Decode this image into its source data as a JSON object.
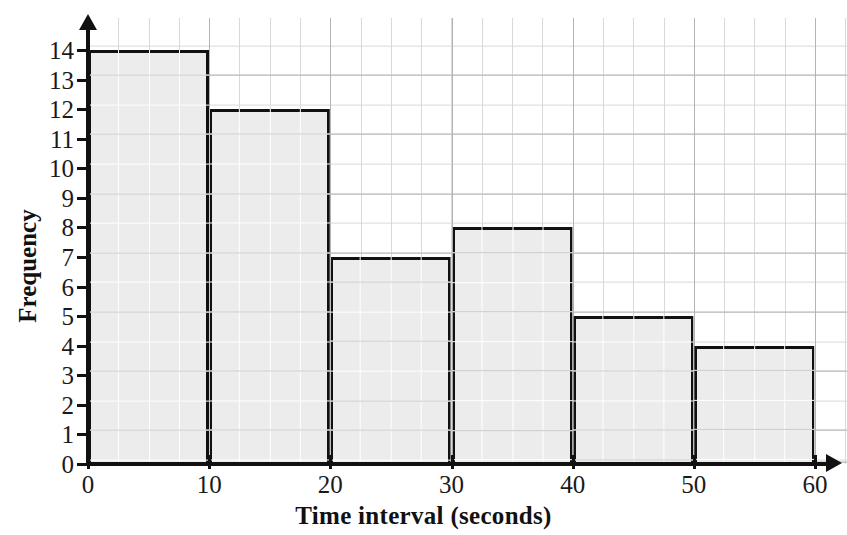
{
  "chart_data": {
    "type": "bar",
    "title": "",
    "xlabel": "Time interval (seconds)",
    "ylabel": "Frequency",
    "categories": [
      "0-10",
      "10-20",
      "20-30",
      "30-40",
      "40-50",
      "50-60"
    ],
    "bin_edges": [
      0,
      10,
      20,
      30,
      40,
      50,
      60
    ],
    "values": [
      14,
      12,
      7,
      8,
      5,
      4
    ],
    "x_tick_labels": [
      "0",
      "10",
      "20",
      "30",
      "40",
      "50",
      "60"
    ],
    "y_tick_labels": [
      "0",
      "1",
      "2",
      "3",
      "4",
      "5",
      "6",
      "7",
      "8",
      "9",
      "10",
      "11",
      "12",
      "13",
      "14"
    ],
    "xlim": [
      0,
      60
    ],
    "ylim": [
      0,
      14
    ],
    "grid": true,
    "legend": "none",
    "bar_fill_color": "#ececec",
    "bar_edge_color": "#111111",
    "grid_minor_color": "#d9d9d9",
    "grid_major_color": "#b4b4b4",
    "axis_color": "#111111"
  },
  "axes": {
    "x_title": "Time interval (seconds)",
    "y_title": "Frequency"
  },
  "top_caption": ""
}
